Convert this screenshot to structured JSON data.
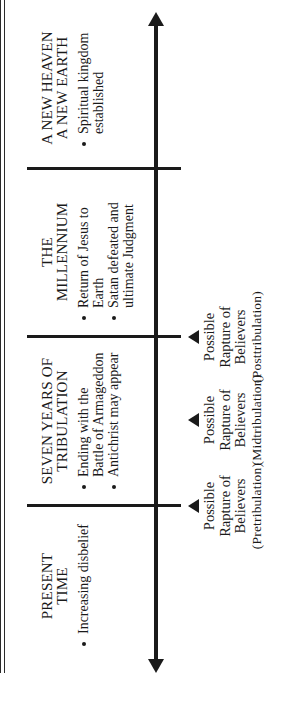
{
  "diagram": {
    "orientation": "rotated-90-ccw",
    "axis": {
      "direction": "timeline",
      "arrows": "both-ends"
    },
    "eras": [
      {
        "title": "PRESENT\nTIME",
        "bullets": [
          "Increasing disbelief"
        ]
      },
      {
        "title": "SEVEN YEARS OF\nTRIBULATION",
        "bullets": [
          "Ending with the Battle of Armageddon",
          "Antichrist may appear"
        ]
      },
      {
        "title": "THE\nMILLENNIUM",
        "bullets": [
          "Return of Jesus to Earth",
          "Satan defeated and ultimate Judgment"
        ]
      },
      {
        "title": "A NEW HEAVEN\nA NEW EARTH",
        "bullets": [
          "Spiritual kingdom established"
        ]
      }
    ],
    "raptures": [
      {
        "text": "Possible\nRapture of\nBelievers",
        "label": "(Pretribulation)"
      },
      {
        "text": "Possible\nRapture of\nBelievers",
        "label": "(Midtribulation)"
      },
      {
        "text": "Possible\nRapture of\nBelievers",
        "label": "(Posttribulation)"
      }
    ]
  },
  "colors": {
    "ink": "#1a1a1a",
    "background": "#ffffff"
  }
}
